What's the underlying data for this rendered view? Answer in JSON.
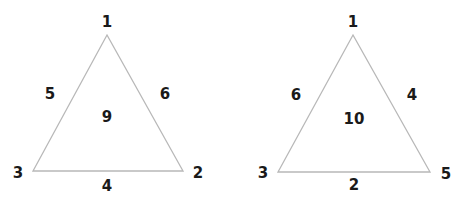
{
  "line_color": "#b8b8b8",
  "text_color": "#1a1a1a",
  "triangles": [
    {
      "center": "9",
      "vertices": {
        "top": "1",
        "bottom_right": "2",
        "bottom_left": "3"
      },
      "edges": {
        "left": "5",
        "right": "6",
        "bottom": "4"
      }
    },
    {
      "center": "10",
      "vertices": {
        "top": "1",
        "bottom_right": "5",
        "bottom_left": "3"
      },
      "edges": {
        "left": "6",
        "right": "4",
        "bottom": "2"
      }
    }
  ]
}
